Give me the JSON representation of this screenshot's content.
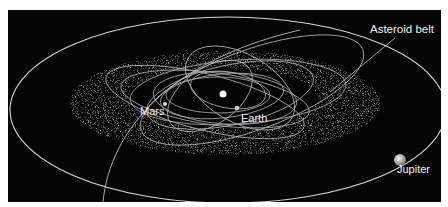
{
  "diagram": {
    "background_color": "#050505",
    "orbit_color": "#d8d8d8",
    "labels": {
      "asteroid_belt": "Asteroid belt",
      "mars": "Mars",
      "earth": "Earth",
      "jupiter": "Jupiter"
    },
    "bodies": [
      {
        "name": "Sun",
        "x": 223,
        "y": 94
      },
      {
        "name": "Mars",
        "x": 165,
        "y": 104
      },
      {
        "name": "Earth",
        "x": 237,
        "y": 108
      },
      {
        "name": "Jupiter",
        "x": 400,
        "y": 160
      }
    ]
  }
}
